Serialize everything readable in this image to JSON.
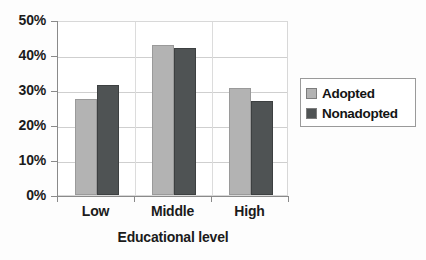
{
  "chart_data": {
    "type": "bar",
    "title": "",
    "xlabel": "Educational level",
    "ylabel": "",
    "categories": [
      "Low",
      "Middle",
      "High"
    ],
    "series": [
      {
        "name": "Adopted",
        "color": "#b3b3b3",
        "values": [
          27.5,
          43,
          30.5
        ]
      },
      {
        "name": "Nonadopted",
        "color": "#4f5354",
        "values": [
          31.5,
          42,
          27
        ]
      }
    ],
    "ylim": [
      0,
      50
    ],
    "ytick_values": [
      0,
      10,
      20,
      30,
      40,
      50
    ],
    "ytick_labels": [
      "0%",
      "10%",
      "20%",
      "30%",
      "40%",
      "50%"
    ],
    "grid": true,
    "legend_position": "right"
  },
  "legend": {
    "entries": [
      {
        "label": "Adopted",
        "swatch": "adopted-swatch"
      },
      {
        "label": "Nonadopted",
        "swatch": "nonadopted-swatch"
      }
    ]
  }
}
